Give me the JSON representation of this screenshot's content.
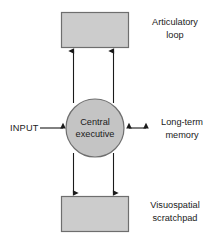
{
  "diagram": {
    "type": "block-diagram",
    "background_color": "#ffffff",
    "box_fill_color": "#cccccc",
    "circle_fill_color": "#c4c4c4",
    "stroke_color": "#6e6e6e",
    "connector_color": "#1a1a1a"
  },
  "nodes": {
    "top_box": {
      "label": "",
      "shape": "rectangle"
    },
    "center": {
      "line1": "Central",
      "line2": "executive",
      "shape": "circle"
    },
    "bottom_box": {
      "label": "",
      "shape": "rectangle"
    }
  },
  "labels": {
    "top": {
      "line1": "Articulatory",
      "line2": "loop"
    },
    "right": {
      "line1": "Long-term",
      "line2": "memory"
    },
    "bottom": {
      "line1": "Visuospatial",
      "line2": "scratchpad"
    },
    "input": "INPUT"
  },
  "connectors": [
    {
      "name": "center-to-articulatory-loop-left",
      "direction": "up",
      "heads": 1
    },
    {
      "name": "center-to-articulatory-loop-right",
      "direction": "up",
      "heads": 1
    },
    {
      "name": "center-to-visuospatial-left",
      "direction": "down",
      "heads": 1
    },
    {
      "name": "center-to-visuospatial-right",
      "direction": "down",
      "heads": 1
    },
    {
      "name": "input-to-center",
      "direction": "right",
      "heads": 1
    },
    {
      "name": "center-to-long-term-memory",
      "direction": "bidirectional",
      "heads": 2
    }
  ]
}
